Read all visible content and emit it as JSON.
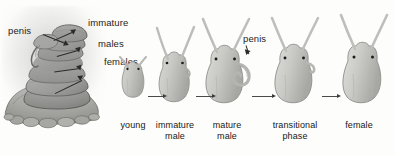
{
  "figure": {
    "background_color": "#fdfdfb",
    "ink_color": "#1d1d1d",
    "body_fill": "#c9c9c7",
    "body_shade": "#a9a9a7",
    "stack_fill": "#8c8c8a"
  },
  "stack": {
    "caption_labels": [
      {
        "id": "penis",
        "text": "penis",
        "x": 8,
        "y": 25
      },
      {
        "id": "immature",
        "text": "immature",
        "x": 88,
        "y": 17
      },
      {
        "id": "males",
        "text": "males",
        "x": 98,
        "y": 38
      },
      {
        "id": "females",
        "text": "females",
        "x": 104,
        "y": 56
      }
    ]
  },
  "stages": [
    {
      "id": "young",
      "label": "young",
      "label_line_2": "",
      "center_x": 133,
      "label_y": 120
    },
    {
      "id": "immature-male",
      "label": "immature",
      "label_line_2": "male",
      "center_x": 175,
      "label_y": 120
    },
    {
      "id": "mature-male",
      "label": "mature",
      "label_line_2": "male",
      "center_x": 227,
      "label_y": 120
    },
    {
      "id": "transitional",
      "label": "transitional",
      "label_line_2": "phase",
      "center_x": 295,
      "label_y": 120
    },
    {
      "id": "female",
      "label": "female",
      "label_line_2": "",
      "center_x": 358,
      "label_y": 120
    }
  ],
  "annotations": [
    {
      "id": "penis-right",
      "text": "penis",
      "x": 243,
      "y": 33
    }
  ],
  "chain_arrows": [
    {
      "from": "young",
      "to": "immature-male",
      "x": 148,
      "y": 96,
      "length": 16
    },
    {
      "from": "immature-male",
      "to": "mature-male",
      "x": 196,
      "y": 96,
      "length": 17
    },
    {
      "from": "mature-male",
      "to": "transitional",
      "x": 252,
      "y": 96,
      "length": 21
    },
    {
      "from": "transitional",
      "to": "female",
      "x": 322,
      "y": 96,
      "length": 16
    }
  ]
}
